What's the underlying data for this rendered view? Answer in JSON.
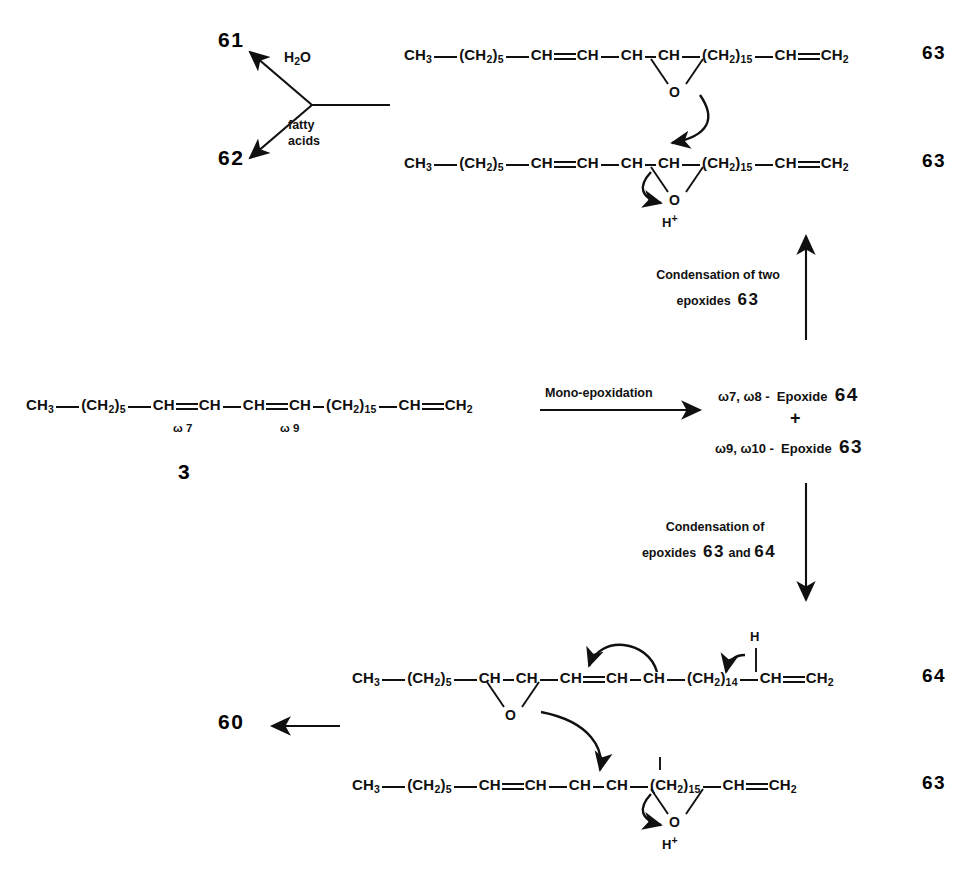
{
  "scheme": {
    "title": "Biosynthetic scheme: mono-epoxidation and condensation of epoxides",
    "compounds": {
      "c3": "3",
      "c60": "60",
      "c61": "61",
      "c62": "62",
      "c63": "63",
      "c64": "64"
    },
    "branch_arrow": {
      "label_water": "H",
      "label_water_sub": "2",
      "label_water_o": "O",
      "label_fatty_line1": "fatty",
      "label_fatty_line2": "acids",
      "target_top": "61",
      "target_bottom": "62"
    },
    "steps": [
      {
        "id": "mono-epoxidation",
        "label": "Mono-epoxidation",
        "direction": "right"
      },
      {
        "id": "condensation-two-63",
        "label_line1": "Condensation of two",
        "label_line2": "epoxides",
        "label_bold": "63",
        "direction": "up"
      },
      {
        "id": "condensation-63-64",
        "label_line1": "Condensation of",
        "label_line2": "epoxides",
        "label_bold_a": "63",
        "label_and": "and",
        "label_bold_b": "64",
        "direction": "down"
      }
    ],
    "products": {
      "line1": "ω7, ω8 -",
      "name1": "Epoxide",
      "num1": "64",
      "plus": "+",
      "line2": "ω9, ω10 -",
      "name2": "Epoxide",
      "num2": "63"
    },
    "labels": {
      "omega7": "ω 7",
      "omega9": "ω 9",
      "oxygen": "O",
      "hplus_h": "H",
      "hplus_charge": "+",
      "hydrogen": "H"
    },
    "formulas": {
      "triene_3": {
        "text": "CH3 — (CH2)5 — CH=CH — CH=CH — (CH2)15 — CH=CH2",
        "terminal_ch3": "CH",
        "terminal_ch3_sub": "3",
        "ch2_group": "(CH",
        "ch2_group_sub": "2",
        "ch2_close": ")",
        "n5": "5",
        "n15": "15",
        "n14": "14",
        "ch": "CH",
        "ch2_term": "CH",
        "ch2_term_sub": "2"
      }
    }
  }
}
